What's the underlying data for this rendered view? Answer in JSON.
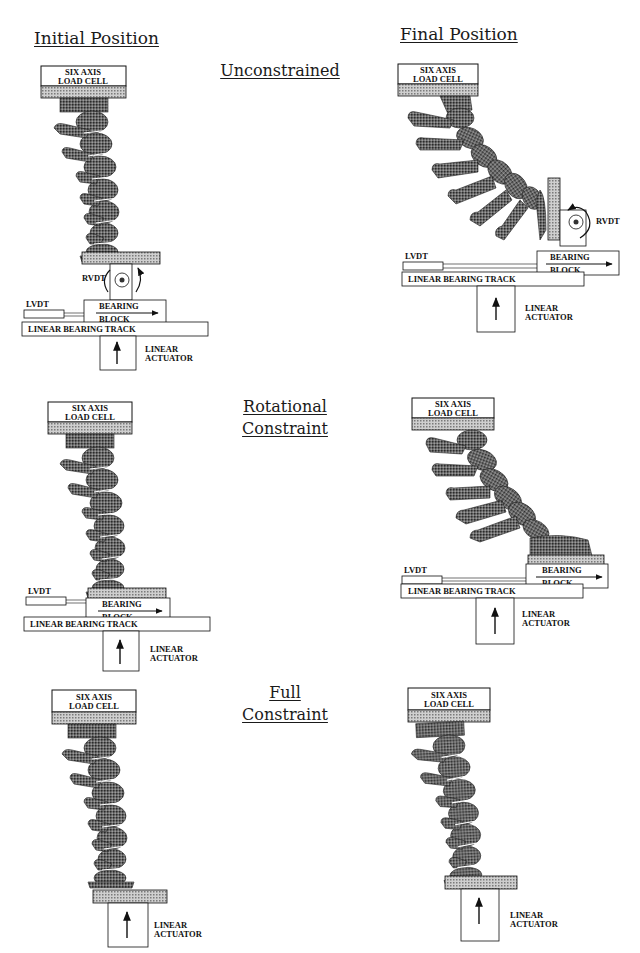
{
  "headers": {
    "initial": "Initial Position",
    "final": "Final Position"
  },
  "rows": [
    {
      "id": "unconstrained",
      "label_lines": [
        "Unconstrained"
      ]
    },
    {
      "id": "rotational",
      "label_lines": [
        "Rotational",
        "Constraint"
      ]
    },
    {
      "id": "full",
      "label_lines": [
        "Full",
        "Constraint"
      ]
    }
  ],
  "component_labels": {
    "load_cell_1": "SIX AXIS",
    "load_cell_2": "LOAD CELL",
    "rvdt": "RVDT",
    "lvdt": "LVDT",
    "bearing": "BEARING",
    "block": "BLOCK",
    "track": "LINEAR BEARING TRACK",
    "actuator_1": "LINEAR",
    "actuator_2": "ACTUATOR"
  },
  "colors": {
    "ink": "#111111",
    "hatch_light": "#bdbdbd",
    "bone": "#555555",
    "paper": "#ffffff"
  }
}
